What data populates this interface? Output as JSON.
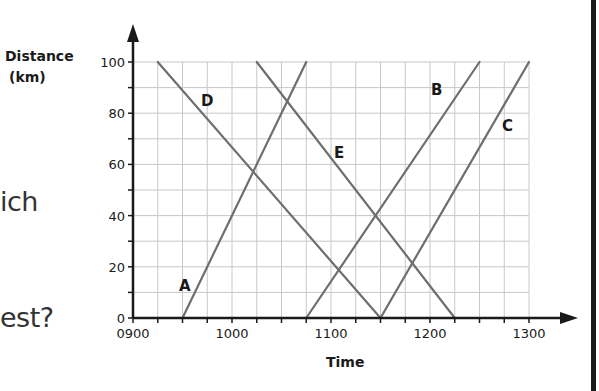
{
  "question_fragments": [
    {
      "text": "ich",
      "x": 0,
      "y": 186
    },
    {
      "text": "est?",
      "x": 0,
      "y": 302
    }
  ],
  "chart_data": {
    "type": "line",
    "title": "",
    "xlabel": "Time",
    "ylabel": "Distance (km)",
    "ylabel_lines": [
      "Distance",
      "(km)"
    ],
    "xlim": [
      "0900",
      "1300"
    ],
    "ylim": [
      0,
      100
    ],
    "x_ticks": [
      "0900",
      "1000",
      "1100",
      "1200",
      "1300"
    ],
    "y_ticks": [
      0,
      20,
      40,
      60,
      80,
      100
    ],
    "grid": {
      "x_minor_minutes": 15,
      "y_minor_km": 10
    },
    "series": [
      {
        "name": "A",
        "points": [
          {
            "time": "0930",
            "distance": 0
          },
          {
            "time": "1045",
            "distance": 100
          }
        ],
        "label_pos": {
          "x": 179,
          "y": 291
        }
      },
      {
        "name": "B",
        "points": [
          {
            "time": "1045",
            "distance": 0
          },
          {
            "time": "1230",
            "distance": 100
          }
        ],
        "label_pos": {
          "x": 431,
          "y": 95
        }
      },
      {
        "name": "C",
        "points": [
          {
            "time": "1130",
            "distance": 0
          },
          {
            "time": "1300",
            "distance": 100
          }
        ],
        "label_pos": {
          "x": 502,
          "y": 131
        }
      },
      {
        "name": "D",
        "points": [
          {
            "time": "0915",
            "distance": 100
          },
          {
            "time": "1130",
            "distance": 0
          }
        ],
        "label_pos": {
          "x": 201,
          "y": 106
        }
      },
      {
        "name": "E",
        "points": [
          {
            "time": "1015",
            "distance": 100
          },
          {
            "time": "1215",
            "distance": 0
          }
        ],
        "label_pos": {
          "x": 334,
          "y": 158
        }
      }
    ]
  },
  "colors": {
    "axis": "#1a1a1a",
    "grid": "#c8c8c8",
    "series_line": "#6e6e6e",
    "text": "#1a1a1a"
  }
}
